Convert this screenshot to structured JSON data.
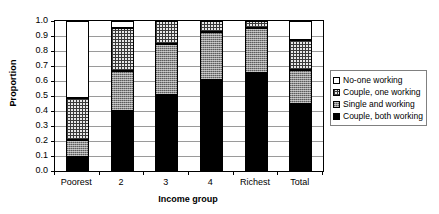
{
  "chart_data": {
    "type": "bar",
    "subtype": "stacked-bar",
    "title": "",
    "xlabel": "Income group",
    "ylabel": "Proportion",
    "ylim": [
      0.0,
      1.0
    ],
    "yticks": [
      "0.0",
      "0.1",
      "0.2",
      "0.3",
      "0.4",
      "0.5",
      "0.6",
      "0.7",
      "0.8",
      "0.9",
      "1.0"
    ],
    "ytick_values": [
      0.0,
      0.1,
      0.2,
      0.3,
      0.4,
      0.5,
      0.6,
      0.7,
      0.8,
      0.9,
      1.0
    ],
    "grid": true,
    "grid_axis": "y",
    "legend_position": "right",
    "categories": [
      "Poorest",
      "2",
      "3",
      "4",
      "Richest",
      "Total"
    ],
    "stack_order_bottom_to_top": [
      "Couple, both working",
      "Single and working",
      "Couple, one working",
      "No-one working"
    ],
    "series": [
      {
        "name": "Couple, both working",
        "pattern": "solid-black",
        "color": "#000000",
        "values": [
          0.095,
          0.4,
          0.51,
          0.61,
          0.655,
          0.445
        ]
      },
      {
        "name": "Single and working",
        "pattern": "stipple-gray",
        "color": "#8e8e8e",
        "values": [
          0.11,
          0.27,
          0.335,
          0.315,
          0.3,
          0.23
        ]
      },
      {
        "name": "Couple, one working",
        "pattern": "crosshatch",
        "color": "#e8e8e8",
        "values": [
          0.285,
          0.285,
          0.155,
          0.075,
          0.045,
          0.2
        ]
      },
      {
        "name": "No-one working",
        "pattern": "white-empty",
        "color": "#ffffff",
        "values": [
          0.51,
          0.045,
          0.0,
          0.0,
          0.0,
          0.125
        ]
      }
    ],
    "cumulative_tops": {
      "Poorest": [
        0.095,
        0.205,
        0.49,
        1.0
      ],
      "2": [
        0.4,
        0.67,
        0.955,
        1.0
      ],
      "3": [
        0.51,
        0.845,
        1.0,
        1.0
      ],
      "4": [
        0.61,
        0.925,
        1.0,
        1.0
      ],
      "Richest": [
        0.655,
        0.955,
        1.0,
        1.0
      ],
      "Total": [
        0.445,
        0.675,
        0.875,
        1.0
      ]
    }
  },
  "legend": {
    "items": [
      {
        "label": "No-one working",
        "swatch": "white-empty"
      },
      {
        "label": "Couple, one working",
        "swatch": "crosshatch"
      },
      {
        "label": "Single and working",
        "swatch": "stipple-gray"
      },
      {
        "label": "Couple, both working",
        "swatch": "solid-black"
      }
    ]
  },
  "axes": {
    "y_title": "Proportion",
    "x_title": "Income group"
  }
}
